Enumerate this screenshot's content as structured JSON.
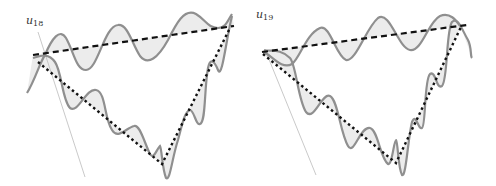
{
  "figure": {
    "panels": [
      {
        "id": "left",
        "label_main": "u",
        "label_sub": "18",
        "label_pos": [
          26,
          24
        ],
        "tangent": [
          [
            38,
            32
          ],
          [
            85,
            177
          ]
        ],
        "dashed_line": [
          [
            33,
            55
          ],
          [
            234,
            26
          ]
        ],
        "dotted_line": [
          [
            38,
            62
          ],
          [
            162,
            164
          ],
          [
            230,
            28
          ]
        ],
        "curve_upper": "M 27 93 C 35 80, 40 62, 45 55 C 52 38, 60 28, 66 38 C 74 52, 76 70, 86 70 C 98 70, 104 26, 118 25 C 128 24, 132 44, 140 56 C 148 66, 158 58, 168 40 C 176 24, 184 8, 196 14 C 206 20, 208 28, 218 28 C 226 28, 228 20, 232 14",
        "curve_lower": "M 33 58 C 40 56, 48 52, 55 62 C 62 72, 62 100, 70 108 C 78 114, 86 88, 96 90 C 106 92, 104 118, 112 130 C 118 140, 126 128, 134 126 C 140 124, 144 142, 150 154 C 154 160, 156 150, 160 146 C 162 150, 162 168, 166 178 C 170 182, 172 158, 178 140 C 182 126, 184 112, 190 110 C 194 110, 196 126, 200 124 C 206 122, 204 90, 208 68 C 210 58, 214 60, 218 70 C 222 80, 226 40, 232 16"
      },
      {
        "id": "right",
        "label_main": "u",
        "label_sub": "19",
        "label_pos": [
          256,
          18
        ],
        "tangent": [
          [
            266,
            52
          ],
          [
            316,
            175
          ]
        ],
        "dashed_line": [
          [
            262,
            52
          ],
          [
            467,
            25
          ]
        ],
        "dotted_line": [
          [
            263,
            54
          ],
          [
            396,
            163
          ],
          [
            461,
            27
          ]
        ],
        "curve_upper": "M 264 52 C 272 56, 282 70, 292 64 C 300 58, 306 34, 320 28 C 330 24, 336 56, 346 60 C 356 62, 366 28, 378 18 C 390 10, 398 48, 410 50 C 422 52, 428 22, 440 16 C 450 12, 456 20, 460 26",
        "curve_lower": "M 264 50 C 270 52, 280 48, 290 58 C 296 64, 298 100, 306 112 C 314 122, 322 92, 330 96 C 338 100, 340 132, 348 146 C 354 156, 360 126, 370 128 C 378 130, 380 158, 388 164 C 392 166, 394 140, 396 140 C 398 142, 398 168, 402 175 C 406 178, 408 138, 412 122 C 416 112, 418 130, 422 128 C 426 126, 424 80, 430 74 C 436 70, 436 90, 442 86 C 448 80, 446 30, 452 22 C 458 16, 462 30, 468 40 C 472 48, 470 56, 472 58"
      }
    ]
  }
}
